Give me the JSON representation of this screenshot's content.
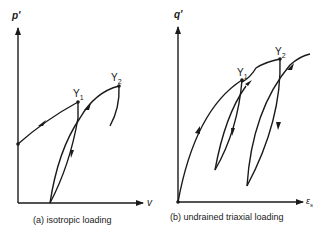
{
  "panels": [
    {
      "id": "a",
      "y_axis_label": "p'",
      "x_axis_label": "v",
      "caption": "(a) isotropic loading",
      "points": [
        {
          "name": "Y",
          "sub": "1"
        },
        {
          "name": "Y",
          "sub": "2"
        }
      ]
    },
    {
      "id": "b",
      "y_axis_label": "q'",
      "x_axis_label": "ε",
      "x_axis_label_sub": "s",
      "caption": "(b) undrained triaxial loading",
      "points": [
        {
          "name": "Y",
          "sub": "1"
        },
        {
          "name": "Y",
          "sub": "2"
        }
      ]
    }
  ],
  "colors": {
    "line": "#1a1a1a",
    "background": "#ffffff"
  }
}
